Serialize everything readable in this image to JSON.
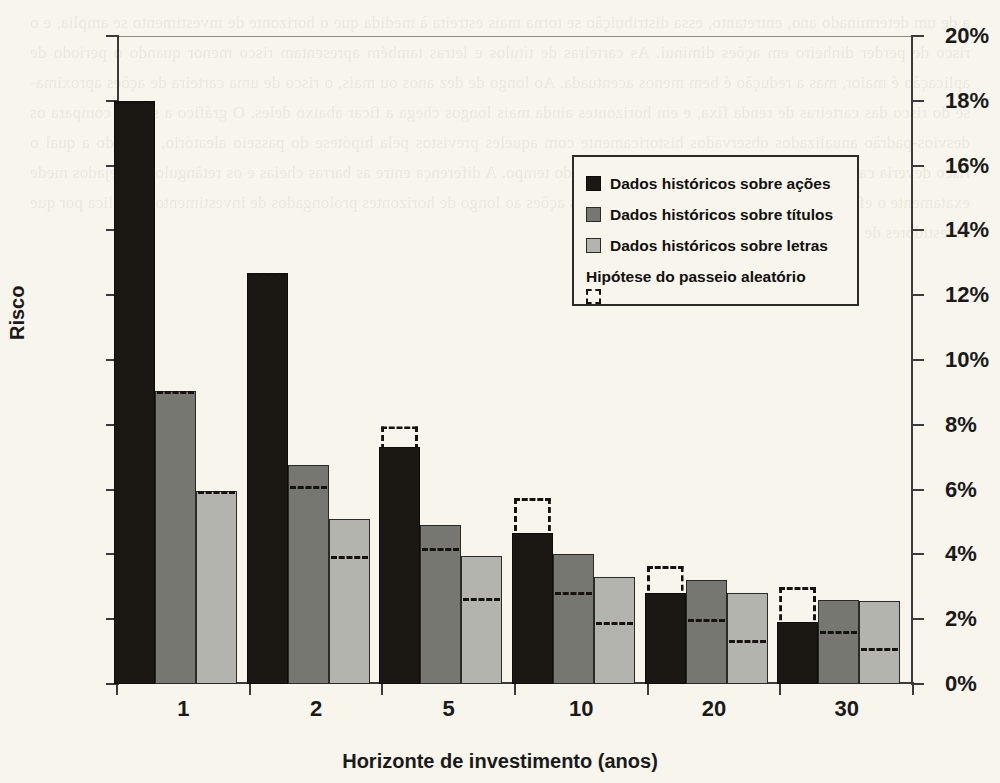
{
  "chart_data": {
    "type": "bar",
    "title": "",
    "xlabel": "Horizonte de investimento (anos)",
    "ylabel": "Risco",
    "categories": [
      "1",
      "2",
      "5",
      "10",
      "20",
      "30"
    ],
    "ylim": [
      0,
      20
    ],
    "ytick_labels": [
      "0%",
      "2%",
      "4%",
      "6%",
      "8%",
      "10%",
      "12%",
      "14%",
      "16%",
      "18%",
      "20%"
    ],
    "ytick_values": [
      0,
      2,
      4,
      6,
      8,
      10,
      12,
      14,
      16,
      18,
      20
    ],
    "y_unit": "%",
    "grid": false,
    "legend_position": "upper-right-inside",
    "series": [
      {
        "name": "Dados históricos sobre ações",
        "color": "#1b1713",
        "style": "filled",
        "values": [
          18.0,
          12.7,
          7.3,
          4.65,
          2.8,
          1.9
        ]
      },
      {
        "name": "Dados históricos sobre títulos",
        "color": "#777772",
        "style": "filled",
        "values": [
          9.05,
          6.75,
          4.9,
          4.0,
          3.2,
          2.6
        ]
      },
      {
        "name": "Dados históricos sobre letras",
        "color": "#b4b4ae",
        "style": "filled",
        "values": [
          5.95,
          5.1,
          3.95,
          3.3,
          2.8,
          2.55
        ]
      },
      {
        "name": "Hipótese do passeio aleatório",
        "color": "#15120f",
        "style": "dashed-outline",
        "values_por_serie": [
          [
            18.0,
            12.7,
            7.95,
            5.75,
            3.65,
            3.0
          ],
          [
            9.05,
            6.1,
            4.2,
            2.85,
            2.0,
            1.65
          ],
          [
            5.95,
            3.95,
            2.65,
            1.9,
            1.35,
            1.1
          ]
        ]
      }
    ]
  },
  "axes": {
    "y_left_labels": [
      "20%",
      "18%",
      "16%",
      "14%",
      "12%",
      "10%",
      "8%",
      "6%",
      "4%",
      "2%",
      "0%"
    ],
    "y_right_labels": [
      "20%",
      "18%",
      "16%",
      "14%",
      "12%",
      "10%",
      "8%",
      "6%",
      "4%",
      "2%",
      "0%"
    ],
    "y_axis_title": "Risco",
    "x_axis_title": "Horizonte de investimento (anos)",
    "x_labels": [
      "1",
      "2",
      "5",
      "10",
      "20",
      "30"
    ]
  },
  "legend": {
    "items": [
      {
        "label": "Dados históricos sobre ações",
        "swatch": "s0"
      },
      {
        "label": "Dados históricos sobre títulos",
        "swatch": "s1"
      },
      {
        "label": "Dados históricos sobre letras",
        "swatch": "s2"
      },
      {
        "label": "Hipótese do passeio aleatório",
        "swatch": "rw"
      }
    ]
  },
  "page": {
    "background_color": "#f7f5ec",
    "ink_color": "#1a1a1a",
    "ghost_text": "a de um determinado ano, entretanto, essa distribuição se torna mais estreita à medida que o horizonte de investimento se amplia, e o risco de perder dinheiro em ações diminui. As carteiras de títulos e letras também apresentam risco menor quando o período de aplicação é maior, mas a redução é bem menos acentuada. Ao longo de dez anos ou mais, o risco de uma carteira de ações aproxima-se do risco das carteiras de renda fixa, e em horizontes ainda mais longos chega a ficar abaixo deles. O gráfico a seguir compara os desvios-padrão anualizados observados historicamente com aqueles previstos pela hipótese do passeio aleatório, segundo a qual o risco deveria cair apenas na proporção da raiz quadrada do tempo. A diferença entre as barras cheias e os retângulos tracejados mede exatamente o efeito da reversão à média nos retornos das ações ao longo de horizontes prolongados de investimento e explica por que investidores de longo prazo podem assumir mais risco."
  }
}
